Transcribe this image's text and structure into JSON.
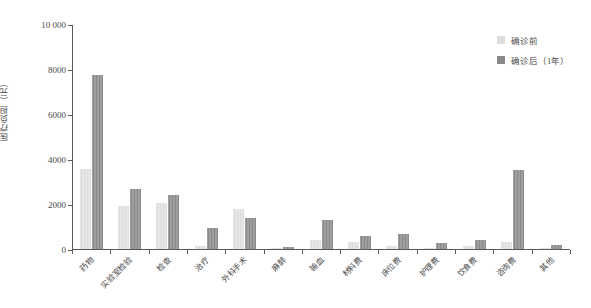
{
  "chart_data": {
    "type": "bar",
    "title": "",
    "xlabel": "",
    "ylabel": "医疗负担（元）",
    "ylim": [
      0,
      10000
    ],
    "yticks": [
      0,
      2000,
      4000,
      6000,
      8000,
      10000
    ],
    "ytick_labels": [
      "0",
      "2000",
      "4000",
      "6000",
      "8000",
      "10 000"
    ],
    "grid": false,
    "legend_position": "top-right",
    "categories": [
      "药物",
      "实验室检验",
      "检查",
      "治疗",
      "外科手术",
      "麻醉",
      "输血",
      "材料费",
      "床位费",
      "护理费",
      "饮食费",
      "咨询费",
      "其他"
    ],
    "series": [
      {
        "name": "确诊前",
        "color": "#dcdcdc",
        "values": [
          3560,
          1930,
          2030,
          120,
          1770,
          40,
          420,
          330,
          130,
          30,
          130,
          330,
          20
        ]
      },
      {
        "name": "确诊后（1年）",
        "color": "#8a8a8a",
        "values": [
          7720,
          2650,
          2380,
          940,
          1360,
          90,
          1290,
          560,
          680,
          270,
          380,
          3490,
          170
        ]
      }
    ]
  },
  "legend": {
    "items": [
      {
        "label": "确诊前",
        "color": "#dcdcdc"
      },
      {
        "label": "确诊后（1年）",
        "color": "#8a8a8a"
      }
    ]
  }
}
